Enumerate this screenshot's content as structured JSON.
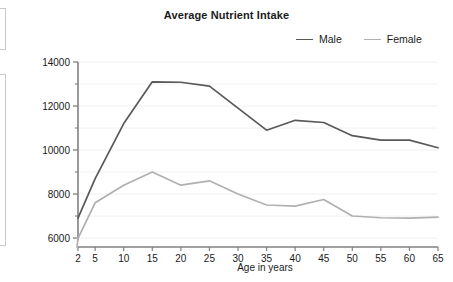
{
  "edge_fragments": [
    {
      "name": "clipped-panel-top"
    },
    {
      "name": "clipped-panel-bottom"
    }
  ],
  "chart_data": {
    "type": "line",
    "title": "Average Nutrient Intake",
    "xlabel": "Age in years",
    "ylabel": "Average daily energy intake in kilojoules",
    "x": [
      2,
      5,
      10,
      15,
      20,
      25,
      30,
      35,
      40,
      45,
      50,
      55,
      60,
      65
    ],
    "categories": [
      "2",
      "5",
      "10",
      "15",
      "20",
      "25",
      "30",
      "35",
      "40",
      "45",
      "50",
      "55",
      "60",
      "65"
    ],
    "series": [
      {
        "name": "Male",
        "color": "#595959",
        "values": [
          6900,
          8700,
          11200,
          13100,
          13080,
          12900,
          11900,
          10900,
          11350,
          11250,
          10650,
          10450,
          10450,
          10100
        ]
      },
      {
        "name": "Female",
        "color": "#b0b0b0",
        "values": [
          5980,
          7600,
          8400,
          9000,
          8400,
          8600,
          8000,
          7500,
          7450,
          7750,
          7000,
          6920,
          6900,
          6950
        ]
      }
    ],
    "xlim": [
      2,
      65
    ],
    "ylim": [
      5800,
      14400
    ],
    "yticks": [
      6000,
      8000,
      10000,
      12000,
      14000
    ],
    "ytick_labels": [
      "6000",
      "8000",
      "10000",
      "12000",
      "14000"
    ],
    "yminor_ticks": [
      7000,
      9000,
      11000,
      13000
    ],
    "grid": true,
    "grid_color": "#f2f0f0",
    "legend_position": "top-right",
    "axis_color": "#808080"
  }
}
